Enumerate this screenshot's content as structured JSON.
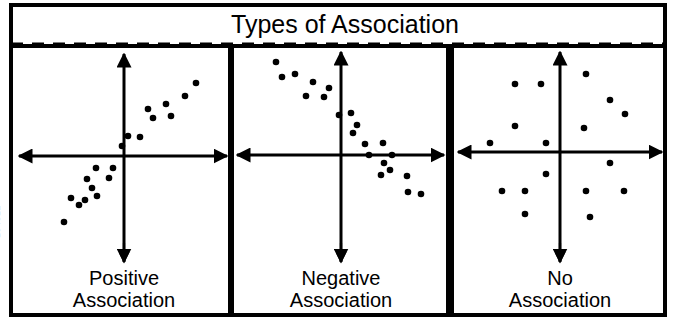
{
  "figure": {
    "title": "Types of Association",
    "watermark": "104312",
    "colors": {
      "ink": "#000000",
      "background": "#ffffff",
      "watermark": "#b9b9b9"
    },
    "frame": {
      "x": 9,
      "y": 3,
      "width": 658,
      "height": 314,
      "stroke_width": 4
    },
    "divider_dashed": {
      "y": 44,
      "x1": 11,
      "x2": 665,
      "dash": "12 9",
      "stroke_width": 3
    }
  },
  "panels": [
    {
      "id": "positive",
      "label_line1": "Positive",
      "label_line2": "Association",
      "box": {
        "x": 11,
        "y": 46,
        "width": 219,
        "height": 269
      },
      "axes": {
        "origin_x": 124,
        "origin_y": 156,
        "x_left": 19,
        "x_right": 227,
        "y_top": 54,
        "y_bottom": 262
      },
      "label_arrow": {
        "x": 124,
        "y_top": 243,
        "y_bottom": 262
      },
      "label_y1": 281,
      "label_y2": 303
    },
    {
      "id": "negative",
      "label_line1": "Negative",
      "label_line2": "Association",
      "box": {
        "x": 232,
        "y": 46,
        "width": 216,
        "height": 269
      },
      "axes": {
        "origin_x": 341,
        "origin_y": 155,
        "x_left": 237,
        "x_right": 444,
        "y_top": 52,
        "y_bottom": 262
      },
      "label_arrow": {
        "x": 341,
        "y_top": 243,
        "y_bottom": 262
      },
      "label_y1": 281,
      "label_y2": 303
    },
    {
      "id": "none",
      "label_line1": "No",
      "label_line2": "Association",
      "box": {
        "x": 452,
        "y": 46,
        "width": 213,
        "height": 269
      },
      "axes": {
        "origin_x": 560,
        "origin_y": 152,
        "x_left": 458,
        "x_right": 662,
        "y_top": 52,
        "y_bottom": 262
      },
      "label_arrow": {
        "x": 560,
        "y_top": 243,
        "y_bottom": 262
      },
      "label_y1": 281,
      "label_y2": 303
    }
  ],
  "chart_data": [
    {
      "type": "scatter",
      "title": "Positive Association",
      "xlabel": "",
      "ylabel": "",
      "grid": false,
      "legend": "none",
      "axis_style": "double-arrow-cartesian-cross",
      "description": "Points trend upward from lower-left to upper-right quadrant",
      "points_px": [
        [
          64,
          222
        ],
        [
          71,
          198
        ],
        [
          79,
          205
        ],
        [
          85,
          200
        ],
        [
          87,
          179
        ],
        [
          92,
          188
        ],
        [
          96,
          168
        ],
        [
          97,
          196
        ],
        [
          109,
          178
        ],
        [
          113,
          168
        ],
        [
          122,
          146
        ],
        [
          128,
          136
        ],
        [
          140,
          137
        ],
        [
          148,
          109
        ],
        [
          153,
          118
        ],
        [
          166,
          104
        ],
        [
          171,
          116
        ],
        [
          185,
          96
        ],
        [
          196,
          83
        ]
      ],
      "x": [
        -60,
        -53,
        -45,
        -39,
        -37,
        -32,
        -28,
        -27,
        -15,
        -11,
        -2,
        4,
        16,
        24,
        29,
        42,
        47,
        61,
        72
      ],
      "y": [
        -66,
        -42,
        -49,
        -44,
        -23,
        -32,
        -12,
        -40,
        -22,
        -12,
        10,
        20,
        19,
        47,
        38,
        52,
        40,
        60,
        73
      ]
    },
    {
      "type": "scatter",
      "title": "Negative Association",
      "xlabel": "",
      "ylabel": "",
      "grid": false,
      "legend": "none",
      "axis_style": "double-arrow-cartesian-cross",
      "description": "Points trend downward from upper-left to lower-right quadrant",
      "points_px": [
        [
          276,
          62
        ],
        [
          282,
          77
        ],
        [
          295,
          74
        ],
        [
          306,
          96
        ],
        [
          313,
          82
        ],
        [
          324,
          97
        ],
        [
          329,
          88
        ],
        [
          339,
          115
        ],
        [
          351,
          113
        ],
        [
          353,
          133
        ],
        [
          357,
          125
        ],
        [
          365,
          144
        ],
        [
          369,
          155
        ],
        [
          381,
          175
        ],
        [
          383,
          143
        ],
        [
          384,
          163
        ],
        [
          390,
          170
        ],
        [
          392,
          155
        ],
        [
          407,
          176
        ],
        [
          408,
          192
        ],
        [
          421,
          194
        ]
      ],
      "x": [
        -65,
        -59,
        -46,
        -35,
        -28,
        -17,
        -12,
        -2,
        10,
        12,
        16,
        24,
        28,
        40,
        42,
        43,
        49,
        51,
        66,
        67,
        80
      ],
      "y": [
        93,
        78,
        81,
        59,
        73,
        58,
        67,
        40,
        42,
        22,
        30,
        11,
        0,
        -20,
        12,
        -8,
        -15,
        0,
        -21,
        -37,
        -39
      ]
    },
    {
      "type": "scatter",
      "title": "No Association",
      "xlabel": "",
      "ylabel": "",
      "grid": false,
      "legend": "none",
      "axis_style": "double-arrow-cartesian-cross",
      "description": "Points scattered randomly with no directional trend",
      "points_px": [
        [
          490,
          143
        ],
        [
          502,
          191
        ],
        [
          515,
          84
        ],
        [
          515,
          126
        ],
        [
          525,
          191
        ],
        [
          525,
          214
        ],
        [
          541,
          84
        ],
        [
          546,
          143
        ],
        [
          546,
          174
        ],
        [
          584,
          128
        ],
        [
          586,
          74
        ],
        [
          586,
          191
        ],
        [
          590,
          217
        ],
        [
          610,
          100
        ],
        [
          610,
          163
        ],
        [
          624,
          191
        ],
        [
          625,
          114
        ]
      ],
      "x": [
        -70,
        -58,
        -45,
        -45,
        -35,
        -35,
        -19,
        -14,
        -14,
        24,
        26,
        26,
        30,
        50,
        50,
        64,
        65
      ],
      "y": [
        9,
        -39,
        68,
        26,
        -39,
        -62,
        68,
        9,
        -22,
        24,
        78,
        -39,
        -65,
        52,
        -11,
        -39,
        38
      ]
    }
  ]
}
